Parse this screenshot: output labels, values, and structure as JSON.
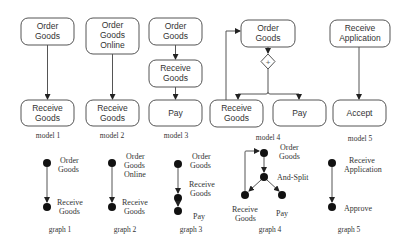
{
  "models": [
    {
      "caption": "model 1",
      "nodes": [
        [
          "Order",
          "Goods"
        ],
        [
          "Receive",
          "Goods"
        ]
      ]
    },
    {
      "caption": "model 2",
      "nodes": [
        [
          "Order",
          "Goods",
          "Online"
        ],
        [
          "Receive",
          "Goods"
        ]
      ]
    },
    {
      "caption": "model 3",
      "nodes": [
        [
          "Order",
          "Goods"
        ],
        [
          "Receive",
          "Goods"
        ],
        [
          "Pay"
        ]
      ]
    },
    {
      "caption": "model 4",
      "nodes": [
        [
          "Order",
          "Goods"
        ],
        [
          "Receive",
          "Goods"
        ],
        [
          "Pay"
        ]
      ],
      "gateway": "+"
    },
    {
      "caption": "model 5",
      "nodes": [
        [
          "Receive",
          "Application"
        ],
        [
          "Accept"
        ]
      ]
    }
  ],
  "graphs": [
    {
      "caption": "graph 1",
      "nodes": [
        [
          "Order",
          "Goods"
        ],
        [
          "Receive",
          "Goods"
        ]
      ]
    },
    {
      "caption": "graph 2",
      "nodes": [
        [
          "Order",
          "Goods",
          "Online"
        ],
        [
          "Receive",
          "Goods"
        ]
      ]
    },
    {
      "caption": "graph 3",
      "nodes": [
        [
          "Order",
          "Goods"
        ],
        [
          "Receive",
          "Goods"
        ],
        [
          "Pay"
        ]
      ]
    },
    {
      "caption": "graph 4",
      "nodes": [
        [
          "Order",
          "Goods"
        ],
        [
          "And-Split"
        ],
        [
          "Receive",
          "Goods"
        ],
        [
          "Pay"
        ]
      ]
    },
    {
      "caption": "graph 5",
      "nodes": [
        [
          "Receive",
          "Application"
        ],
        [
          "Approve"
        ]
      ]
    }
  ]
}
